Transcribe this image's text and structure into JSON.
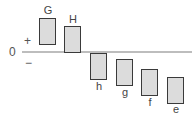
{
  "axis": {
    "zero_label": "0",
    "plus_label": "+",
    "minus_label": "−"
  },
  "bars": [
    {
      "label": "G",
      "side": "positive"
    },
    {
      "label": "H",
      "side": "positive"
    },
    {
      "label": "h",
      "side": "negative"
    },
    {
      "label": "g",
      "side": "negative"
    },
    {
      "label": "f",
      "side": "negative"
    },
    {
      "label": "e",
      "side": "negative"
    }
  ],
  "colors": {
    "box_fill": "#dcdcdc",
    "box_border": "#3a3a3a",
    "baseline": "#bdbdbd"
  }
}
